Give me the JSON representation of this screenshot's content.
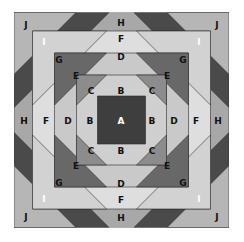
{
  "diagram": {
    "type": "quilt-block-piece-layout",
    "pieces": {
      "A": {
        "label": "A",
        "color": "#3e3e3e",
        "text_color": "#ffffff"
      },
      "B": {
        "label": "B",
        "color": "#cfcfcf",
        "text_color": "#111111"
      },
      "C": {
        "label": "C",
        "color": "#8c8c8c",
        "text_color": "#111111"
      },
      "D": {
        "label": "D",
        "color": "#c9c9c9",
        "text_color": "#111111"
      },
      "E": {
        "label": "E",
        "color": "#686868",
        "text_color": "#111111"
      },
      "F": {
        "label": "F",
        "color": "#dedede",
        "text_color": "#111111"
      },
      "G": {
        "label": "G",
        "color": "#d2d2d2",
        "text_color": "#111111"
      },
      "H": {
        "label": "H",
        "color": "#a8a8a8",
        "text_color": "#111111"
      },
      "I": {
        "label": "I",
        "color": "#4a4a4a",
        "text_color": "#ffffff"
      },
      "J": {
        "label": "J",
        "color": "#b6b6b6",
        "text_color": "#111111"
      }
    },
    "label_positions": [
      {
        "piece": "J",
        "x": 26,
        "y": 25
      },
      {
        "piece": "H",
        "x": 121,
        "y": 23
      },
      {
        "piece": "J",
        "x": 217,
        "y": 25
      },
      {
        "piece": "I",
        "x": 44,
        "y": 42
      },
      {
        "piece": "F",
        "x": 121,
        "y": 39
      },
      {
        "piece": "I",
        "x": 199,
        "y": 42
      },
      {
        "piece": "G",
        "x": 59,
        "y": 60
      },
      {
        "piece": "D",
        "x": 121,
        "y": 57
      },
      {
        "piece": "G",
        "x": 183,
        "y": 60
      },
      {
        "piece": "E",
        "x": 76,
        "y": 76
      },
      {
        "piece": "B",
        "x": 121,
        "y": 91
      },
      {
        "piece": "E",
        "x": 167,
        "y": 76
      },
      {
        "piece": "C",
        "x": 91,
        "y": 91
      },
      {
        "piece": "C",
        "x": 152,
        "y": 91
      },
      {
        "piece": "H",
        "x": 24,
        "y": 121
      },
      {
        "piece": "F",
        "x": 46,
        "y": 121
      },
      {
        "piece": "D",
        "x": 68,
        "y": 121
      },
      {
        "piece": "B",
        "x": 90,
        "y": 121
      },
      {
        "piece": "A",
        "x": 121,
        "y": 121
      },
      {
        "piece": "B",
        "x": 152,
        "y": 121
      },
      {
        "piece": "D",
        "x": 174,
        "y": 121
      },
      {
        "piece": "F",
        "x": 196,
        "y": 121
      },
      {
        "piece": "H",
        "x": 218,
        "y": 121
      },
      {
        "piece": "C",
        "x": 91,
        "y": 151
      },
      {
        "piece": "B",
        "x": 121,
        "y": 151
      },
      {
        "piece": "C",
        "x": 152,
        "y": 151
      },
      {
        "piece": "E",
        "x": 76,
        "y": 166
      },
      {
        "piece": "D",
        "x": 121,
        "y": 184
      },
      {
        "piece": "E",
        "x": 167,
        "y": 166
      },
      {
        "piece": "G",
        "x": 59,
        "y": 183
      },
      {
        "piece": "F",
        "x": 121,
        "y": 200
      },
      {
        "piece": "G",
        "x": 183,
        "y": 183
      },
      {
        "piece": "I",
        "x": 44,
        "y": 199
      },
      {
        "piece": "H",
        "x": 121,
        "y": 218
      },
      {
        "piece": "I",
        "x": 199,
        "y": 199
      },
      {
        "piece": "J",
        "x": 26,
        "y": 217
      },
      {
        "piece": "J",
        "x": 217,
        "y": 217
      }
    ]
  }
}
